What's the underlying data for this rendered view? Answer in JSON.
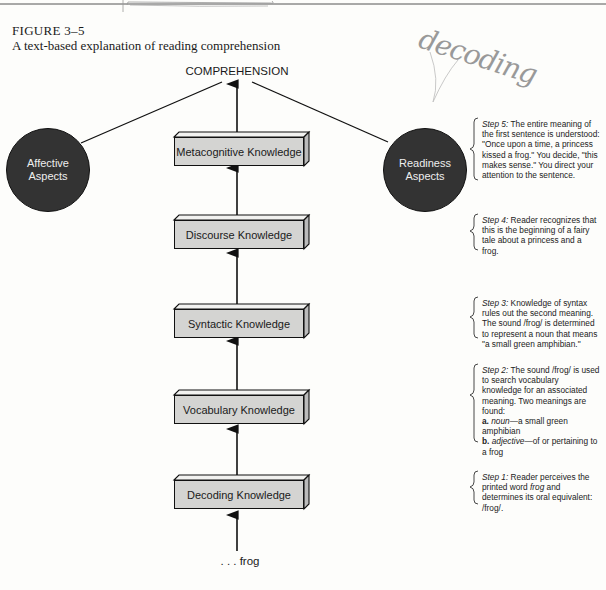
{
  "figure": {
    "label": "FIGURE 3–5",
    "caption": "A text-based explanation of reading comprehension"
  },
  "annotation": {
    "handwritten": "decoding"
  },
  "diagram": {
    "top_node": "COMPREHENSION",
    "bottom_input": ". . . frog",
    "boxes": [
      {
        "label": "Metacognitive Knowledge"
      },
      {
        "label": "Discourse Knowledge"
      },
      {
        "label": "Syntactic Knowledge"
      },
      {
        "label": "Vocabulary Knowledge"
      },
      {
        "label": "Decoding Knowledge"
      }
    ],
    "circles": {
      "left": {
        "line1": "Affective",
        "line2": "Aspects"
      },
      "right": {
        "line1": "Readiness",
        "line2": "Aspects"
      }
    },
    "colors": {
      "box_fill": "#d4d4d2",
      "circle_fill": "#333333",
      "stroke": "#111111"
    }
  },
  "steps": {
    "step5": {
      "label": "Step 5:",
      "text": " The entire meaning of the first sentence is understood: \"Once upon a time, a princess kissed a frog.\" You decide, \"this makes sense.\" You direct your attention to the sentence."
    },
    "step4": {
      "label": "Step 4:",
      "text": " Reader recognizes that this is the beginning of a fairy tale about a princess and a frog."
    },
    "step3": {
      "label": "Step 3:",
      "text": " Knowledge of syntax rules out the second meaning. The sound /frog/ is determined to represent a noun that means \"a small green amphibian.\""
    },
    "step2": {
      "label": "Step 2:",
      "text": " The sound /frog/ is used to search vocabulary knowledge for an associated meaning. Two meanings are found:",
      "a_mark": "a.",
      "a_pos": "noun",
      "a_def": "—a small green amphibian",
      "b_mark": "b.",
      "b_pos": "adjective",
      "b_def": "—of or pertaining to a frog"
    },
    "step1": {
      "label": "Step 1:",
      "text_a": " Reader perceives the printed word ",
      "word": "frog",
      "text_b": " and determines its oral equivalent: /frog/."
    }
  }
}
